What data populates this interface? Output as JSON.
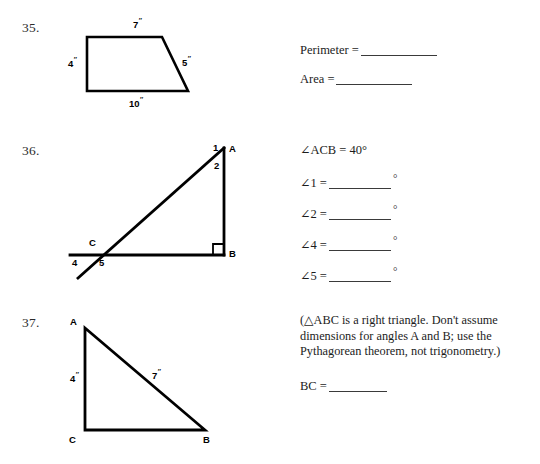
{
  "document": {
    "kind": "geometry worksheet",
    "background_color": "#ffffff",
    "ink_color": "#000000"
  },
  "problems": [
    {
      "number": "35.",
      "figure": {
        "shape": "trapezoid",
        "labels": {
          "top": "7\"",
          "left": "4\"",
          "right": "5\"",
          "bottom": "10\""
        }
      },
      "prompts": [
        {
          "label": "Perimeter =",
          "answer": ""
        },
        {
          "label": "Area =",
          "answer": ""
        }
      ]
    },
    {
      "number": "36.",
      "figure": {
        "shape": "right triangle with extended transversal",
        "vertices": {
          "a": "A",
          "b": "B",
          "c": "C"
        },
        "angle_numbers": {
          "one": "1",
          "two": "2",
          "four": "4",
          "five": "5"
        },
        "right_angle_at": "B"
      },
      "given": "∠ACB = 40°",
      "prompts": [
        {
          "label": "∠1 =",
          "answer": "",
          "unit": "°"
        },
        {
          "label": "∠2 =",
          "answer": "",
          "unit": "°"
        },
        {
          "label": "∠4 =",
          "answer": "",
          "unit": "°"
        },
        {
          "label": "∠5 =",
          "answer": "",
          "unit": "°"
        }
      ]
    },
    {
      "number": "37.",
      "figure": {
        "shape": "right triangle",
        "vertices": {
          "a": "A",
          "b": "B",
          "c": "C"
        },
        "labels": {
          "left": "4\"",
          "hypotenuse": "7\""
        }
      },
      "note": "(△ABC is a right triangle. Don't assume dimensions for angles A and B; use the Pythagorean theorem, not trigonometry.)",
      "prompts": [
        {
          "label": "BC =",
          "answer": ""
        }
      ]
    }
  ],
  "text": {
    "p35_num": "35.",
    "p35_top": "7",
    "p35_left": "4",
    "p35_right": "5",
    "p35_bottom": "10",
    "p35_perimeter": "Perimeter =",
    "p35_area": "Area =",
    "p36_num": "36.",
    "p36_a": "A",
    "p36_b": "B",
    "p36_c": "C",
    "p36_1": "1",
    "p36_2": "2",
    "p36_4": "4",
    "p36_5": "5",
    "p36_given": "∠ACB = 40°",
    "p36_q1": "∠1 =",
    "p36_q2": "∠2 =",
    "p36_q4": "∠4 =",
    "p36_q5": "∠5 =",
    "p36_deg": "°",
    "p37_num": "37.",
    "p37_a": "A",
    "p37_b": "B",
    "p37_c": "C",
    "p37_left": "4",
    "p37_hyp": "7",
    "p37_note": "(△ABC is a right triangle. Don't assume dimensions for angles A and B; use the Pythagorean theorem, not trigonometry.)",
    "p37_bc": "BC =",
    "inch_mark": "″"
  }
}
